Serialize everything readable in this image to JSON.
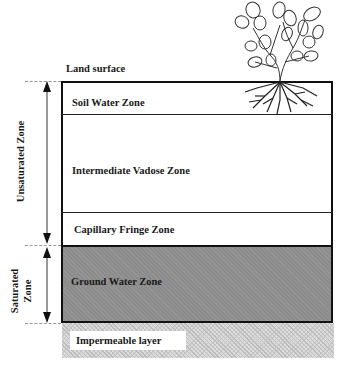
{
  "diagram": {
    "land_surface": "Land surface",
    "zones": [
      {
        "label": "Soil Water Zone",
        "group": "unsaturated"
      },
      {
        "label": "Intermediate Vadose Zone",
        "group": "unsaturated"
      },
      {
        "label": "Capillary Fringe Zone",
        "group": "unsaturated"
      },
      {
        "label": "Ground Water  Zone",
        "group": "saturated"
      }
    ],
    "impermeable": "Impermeable layer",
    "side_labels": {
      "unsaturated": "Unsaturated  Zone",
      "saturated_line1": "Saturated",
      "saturated_line2": "Zone"
    },
    "illustration": "plant-with-roots",
    "colors": {
      "border": "#111111",
      "groundwater_fill": "#8c8c8c",
      "impermeable_fill": "#dcdcdc",
      "background": "#ffffff"
    }
  }
}
